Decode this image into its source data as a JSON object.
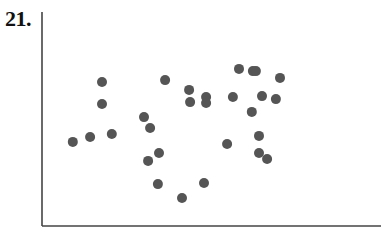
{
  "question": {
    "number_label": "21."
  },
  "chart_data": {
    "type": "scatter",
    "title": "",
    "xlabel": "",
    "ylabel": "",
    "xlim": [
      0,
      100
    ],
    "ylim": [
      0,
      100
    ],
    "grid": false,
    "legend": null,
    "x_ticks": [],
    "y_ticks": [],
    "marker_color": "#555555",
    "axis_color": "#444444",
    "points": [
      {
        "x": 9.1,
        "y": 39.3
      },
      {
        "x": 14.2,
        "y": 41.6
      },
      {
        "x": 20.6,
        "y": 43.0
      },
      {
        "x": 17.7,
        "y": 67.3
      },
      {
        "x": 17.7,
        "y": 57.0
      },
      {
        "x": 30.1,
        "y": 50.9
      },
      {
        "x": 31.9,
        "y": 45.8
      },
      {
        "x": 36.3,
        "y": 68.2
      },
      {
        "x": 34.5,
        "y": 34.1
      },
      {
        "x": 31.3,
        "y": 30.4
      },
      {
        "x": 34.2,
        "y": 19.6
      },
      {
        "x": 41.3,
        "y": 13.1
      },
      {
        "x": 47.8,
        "y": 20.1
      },
      {
        "x": 43.4,
        "y": 63.6
      },
      {
        "x": 43.7,
        "y": 57.9
      },
      {
        "x": 48.4,
        "y": 60.3
      },
      {
        "x": 48.4,
        "y": 57.5
      },
      {
        "x": 58.1,
        "y": 73.4
      },
      {
        "x": 62.2,
        "y": 72.4
      },
      {
        "x": 63.1,
        "y": 72.4
      },
      {
        "x": 70.2,
        "y": 69.2
      },
      {
        "x": 56.3,
        "y": 60.3
      },
      {
        "x": 64.9,
        "y": 60.7
      },
      {
        "x": 69.0,
        "y": 59.3
      },
      {
        "x": 61.9,
        "y": 53.3
      },
      {
        "x": 54.6,
        "y": 38.3
      },
      {
        "x": 64.0,
        "y": 42.1
      },
      {
        "x": 64.0,
        "y": 34.1
      },
      {
        "x": 66.4,
        "y": 31.3
      }
    ]
  }
}
